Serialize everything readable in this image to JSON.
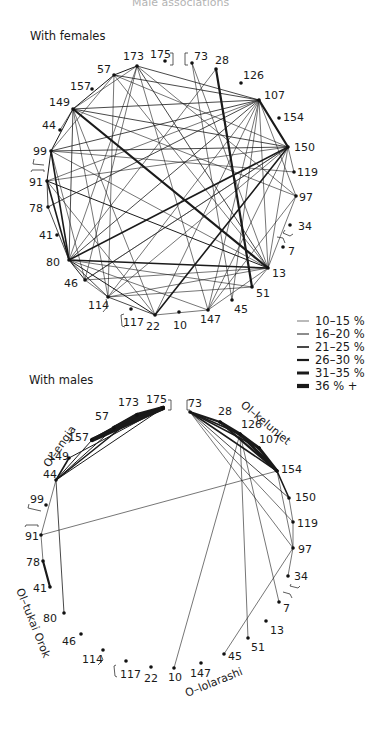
{
  "page_title": "Male associations",
  "legend": {
    "items": [
      {
        "label": "10–15 %",
        "width": 0.6
      },
      {
        "label": "16–20 %",
        "width": 1.0
      },
      {
        "label": "21–25 %",
        "width": 1.6
      },
      {
        "label": "26–30 %",
        "width": 2.2
      },
      {
        "label": "31–35 %",
        "width": 3.0
      },
      {
        "label": "36 % +",
        "width": 4.2
      }
    ]
  },
  "females_graph": {
    "title": "With females",
    "nodes": [
      {
        "id": "173",
        "x": 137,
        "y": 66,
        "lx": 123,
        "ly": 60
      },
      {
        "id": "175",
        "x": 165,
        "y": 61,
        "lx": 150,
        "ly": 58
      },
      {
        "id": "73",
        "x": 192,
        "y": 63,
        "lx": 194,
        "ly": 60
      },
      {
        "id": "28",
        "x": 216,
        "y": 69,
        "lx": 215,
        "ly": 64
      },
      {
        "id": "126",
        "x": 241,
        "y": 83,
        "lx": 243,
        "ly": 79
      },
      {
        "id": "107",
        "x": 259,
        "y": 100,
        "lx": 264,
        "ly": 99
      },
      {
        "id": "154",
        "x": 279,
        "y": 118,
        "lx": 283,
        "ly": 121
      },
      {
        "id": "150",
        "x": 288,
        "y": 147,
        "lx": 294,
        "ly": 151
      },
      {
        "id": "119",
        "x": 294,
        "y": 172,
        "lx": 297,
        "ly": 176
      },
      {
        "id": "97",
        "x": 296,
        "y": 196,
        "lx": 299,
        "ly": 201
      },
      {
        "id": "34",
        "x": 290,
        "y": 225,
        "lx": 298,
        "ly": 230
      },
      {
        "id": "7",
        "x": 283,
        "y": 247,
        "lx": 288,
        "ly": 255
      },
      {
        "id": "13",
        "x": 268,
        "y": 268,
        "lx": 272,
        "ly": 277
      },
      {
        "id": "51",
        "x": 252,
        "y": 287,
        "lx": 256,
        "ly": 297
      },
      {
        "id": "45",
        "x": 232,
        "y": 300,
        "lx": 234,
        "ly": 313
      },
      {
        "id": "147",
        "x": 208,
        "y": 310,
        "lx": 200,
        "ly": 323
      },
      {
        "id": "10",
        "x": 179,
        "y": 312,
        "lx": 173,
        "ly": 329
      },
      {
        "id": "22",
        "x": 155,
        "y": 315,
        "lx": 146,
        "ly": 330
      },
      {
        "id": "117",
        "x": 131,
        "y": 309,
        "lx": 123,
        "ly": 326
      },
      {
        "id": "114",
        "x": 108,
        "y": 297,
        "lx": 88,
        "ly": 309
      },
      {
        "id": "46",
        "x": 85,
        "y": 280,
        "lx": 64,
        "ly": 287
      },
      {
        "id": "80",
        "x": 69,
        "y": 260,
        "lx": 46,
        "ly": 266
      },
      {
        "id": "41",
        "x": 57,
        "y": 235,
        "lx": 39,
        "ly": 239
      },
      {
        "id": "78",
        "x": 48,
        "y": 207,
        "lx": 29,
        "ly": 212
      },
      {
        "id": "91",
        "x": 47,
        "y": 181,
        "lx": 29,
        "ly": 186
      },
      {
        "id": "99",
        "x": 51,
        "y": 151,
        "lx": 33,
        "ly": 155
      },
      {
        "id": "44",
        "x": 60,
        "y": 130,
        "lx": 42,
        "ly": 129
      },
      {
        "id": "149",
        "x": 73,
        "y": 109,
        "lx": 49,
        "ly": 106
      },
      {
        "id": "157",
        "x": 92,
        "y": 89,
        "lx": 70,
        "ly": 90
      },
      {
        "id": "57",
        "x": 114,
        "y": 75,
        "lx": 97,
        "ly": 73
      }
    ],
    "edges": [
      [
        "173",
        "57",
        1.0
      ],
      [
        "173",
        "107",
        0.8
      ],
      [
        "173",
        "149",
        0.6
      ],
      [
        "173",
        "80",
        0.6
      ],
      [
        "173",
        "46",
        0.6
      ],
      [
        "173",
        "13",
        0.8
      ],
      [
        "173",
        "147",
        0.6
      ],
      [
        "173",
        "97",
        0.6
      ],
      [
        "57",
        "149",
        1.0
      ],
      [
        "57",
        "107",
        0.8
      ],
      [
        "57",
        "99",
        0.6
      ],
      [
        "57",
        "13",
        0.6
      ],
      [
        "57",
        "114",
        0.6
      ],
      [
        "57",
        "150",
        0.6
      ],
      [
        "73",
        "13",
        0.6
      ],
      [
        "73",
        "45",
        0.6
      ],
      [
        "28",
        "51",
        2.2
      ],
      [
        "28",
        "80",
        0.6
      ],
      [
        "107",
        "150",
        2.2
      ],
      [
        "107",
        "149",
        0.8
      ],
      [
        "107",
        "99",
        0.8
      ],
      [
        "107",
        "91",
        0.6
      ],
      [
        "107",
        "80",
        0.8
      ],
      [
        "107",
        "114",
        0.6
      ],
      [
        "107",
        "22",
        0.6
      ],
      [
        "107",
        "147",
        0.6
      ],
      [
        "107",
        "13",
        0.6
      ],
      [
        "107",
        "45",
        0.6
      ],
      [
        "107",
        "97",
        0.6
      ],
      [
        "150",
        "149",
        0.8
      ],
      [
        "150",
        "99",
        0.8
      ],
      [
        "150",
        "80",
        1.6
      ],
      [
        "150",
        "91",
        0.6
      ],
      [
        "150",
        "46",
        0.6
      ],
      [
        "150",
        "114",
        0.6
      ],
      [
        "150",
        "22",
        1.6
      ],
      [
        "150",
        "13",
        0.6
      ],
      [
        "150",
        "119",
        0.6
      ],
      [
        "150",
        "147",
        0.6
      ],
      [
        "149",
        "13",
        2.2
      ],
      [
        "149",
        "99",
        1.0
      ],
      [
        "149",
        "80",
        0.8
      ],
      [
        "149",
        "114",
        0.6
      ],
      [
        "149",
        "22",
        0.6
      ],
      [
        "149",
        "97",
        0.6
      ],
      [
        "149",
        "44",
        0.6
      ],
      [
        "99",
        "91",
        1.0
      ],
      [
        "99",
        "80",
        1.6
      ],
      [
        "99",
        "13",
        0.6
      ],
      [
        "99",
        "119",
        0.6
      ],
      [
        "99",
        "46",
        0.6
      ],
      [
        "91",
        "80",
        1.6
      ],
      [
        "91",
        "78",
        0.8
      ],
      [
        "91",
        "13",
        1.0
      ],
      [
        "91",
        "22",
        0.6
      ],
      [
        "78",
        "107",
        0.8
      ],
      [
        "78",
        "80",
        0.8
      ],
      [
        "80",
        "13",
        1.6
      ],
      [
        "80",
        "46",
        1.0
      ],
      [
        "80",
        "114",
        0.8
      ],
      [
        "80",
        "22",
        1.0
      ],
      [
        "80",
        "51",
        0.6
      ],
      [
        "80",
        "147",
        0.6
      ],
      [
        "46",
        "114",
        0.6
      ],
      [
        "46",
        "13",
        0.6
      ],
      [
        "46",
        "150",
        0.6
      ],
      [
        "114",
        "22",
        0.8
      ],
      [
        "114",
        "13",
        0.6
      ],
      [
        "114",
        "51",
        0.6
      ],
      [
        "22",
        "147",
        0.6
      ],
      [
        "147",
        "13",
        0.6
      ],
      [
        "147",
        "97",
        0.6
      ],
      [
        "13",
        "51",
        0.6
      ],
      [
        "13",
        "97",
        0.6
      ]
    ],
    "brackets": [
      {
        "label": "175]",
        "x": 173,
        "y": 62
      },
      {
        "label": "[73",
        "x": 185,
        "y": 62
      }
    ]
  },
  "males_graph": {
    "title": "With males",
    "nodes": [
      {
        "id": "173",
        "x": 137,
        "y": 415,
        "lx": 118,
        "ly": 406
      },
      {
        "id": "175",
        "x": 163,
        "y": 408,
        "lx": 146,
        "ly": 403
      },
      {
        "id": "73",
        "x": 190,
        "y": 412,
        "lx": 188,
        "ly": 407
      },
      {
        "id": "28",
        "x": 220,
        "y": 422,
        "lx": 218,
        "ly": 415
      },
      {
        "id": "126",
        "x": 240,
        "y": 434,
        "lx": 241,
        "ly": 428
      },
      {
        "id": "107",
        "x": 259,
        "y": 448,
        "lx": 259,
        "ly": 443
      },
      {
        "id": "154",
        "x": 277,
        "y": 471,
        "lx": 281,
        "ly": 473
      },
      {
        "id": "150",
        "x": 289,
        "y": 498,
        "lx": 295,
        "ly": 501
      },
      {
        "id": "119",
        "x": 293,
        "y": 522,
        "lx": 297,
        "ly": 527
      },
      {
        "id": "97",
        "x": 293,
        "y": 548,
        "lx": 298,
        "ly": 553
      },
      {
        "id": "34",
        "x": 288,
        "y": 576,
        "lx": 294,
        "ly": 580
      },
      {
        "id": "7",
        "x": 279,
        "y": 602,
        "lx": 283,
        "ly": 612
      },
      {
        "id": "13",
        "x": 266,
        "y": 621,
        "lx": 270,
        "ly": 634
      },
      {
        "id": "51",
        "x": 248,
        "y": 638,
        "lx": 251,
        "ly": 651
      },
      {
        "id": "45",
        "x": 224,
        "y": 654,
        "lx": 228,
        "ly": 660
      },
      {
        "id": "147",
        "x": 201,
        "y": 663,
        "lx": 190,
        "ly": 677
      },
      {
        "id": "10",
        "x": 174,
        "y": 668,
        "lx": 168,
        "ly": 681
      },
      {
        "id": "22",
        "x": 151,
        "y": 667,
        "lx": 144,
        "ly": 682
      },
      {
        "id": "117",
        "x": 126,
        "y": 661,
        "lx": 120,
        "ly": 678
      },
      {
        "id": "114",
        "x": 103,
        "y": 650,
        "lx": 82,
        "ly": 663
      },
      {
        "id": "46",
        "x": 81,
        "y": 634,
        "lx": 62,
        "ly": 645
      },
      {
        "id": "80",
        "x": 64,
        "y": 613,
        "lx": 43,
        "ly": 622
      },
      {
        "id": "41",
        "x": 50,
        "y": 587,
        "lx": 33,
        "ly": 592
      },
      {
        "id": "78",
        "x": 43,
        "y": 561,
        "lx": 26,
        "ly": 566
      },
      {
        "id": "91",
        "x": 41,
        "y": 535,
        "lx": 25,
        "ly": 540
      },
      {
        "id": "99",
        "x": 46,
        "y": 505,
        "lx": 30,
        "ly": 503
      },
      {
        "id": "44",
        "x": 56,
        "y": 480,
        "lx": 43,
        "ly": 478
      },
      {
        "id": "149",
        "x": 69,
        "y": 458,
        "lx": 48,
        "ly": 460
      },
      {
        "id": "157",
        "x": 92,
        "y": 440,
        "lx": 68,
        "ly": 441
      },
      {
        "id": "57",
        "x": 114,
        "y": 428,
        "lx": 95,
        "ly": 420
      }
    ],
    "edges": [
      [
        "173",
        "175",
        4.2
      ],
      [
        "173",
        "57",
        4.2
      ],
      [
        "175",
        "57",
        4.2
      ],
      [
        "175",
        "157",
        4.2
      ],
      [
        "173",
        "157",
        3.0
      ],
      [
        "57",
        "157",
        3.0
      ],
      [
        "175",
        "149",
        1.0
      ],
      [
        "173",
        "44",
        1.6
      ],
      [
        "175",
        "44",
        1.0
      ],
      [
        "57",
        "44",
        1.0
      ],
      [
        "157",
        "44",
        1.0
      ],
      [
        "149",
        "44",
        1.6
      ],
      [
        "44",
        "91",
        0.6
      ],
      [
        "44",
        "80",
        0.8
      ],
      [
        "91",
        "154",
        0.6
      ],
      [
        "91",
        "78",
        0.6
      ],
      [
        "78",
        "41",
        2.2
      ],
      [
        "73",
        "28",
        2.2
      ],
      [
        "73",
        "126",
        1.6
      ],
      [
        "73",
        "107",
        1.6
      ],
      [
        "73",
        "154",
        1.6
      ],
      [
        "73",
        "150",
        0.8
      ],
      [
        "73",
        "97",
        0.6
      ],
      [
        "73",
        "119",
        0.6
      ],
      [
        "28",
        "126",
        3.0
      ],
      [
        "28",
        "107",
        2.2
      ],
      [
        "28",
        "154",
        2.2
      ],
      [
        "126",
        "107",
        3.0
      ],
      [
        "126",
        "154",
        3.0
      ],
      [
        "107",
        "154",
        3.0
      ],
      [
        "126",
        "10",
        0.6
      ],
      [
        "126",
        "51",
        0.6
      ],
      [
        "126",
        "7",
        0.6
      ],
      [
        "154",
        "150",
        1.6
      ],
      [
        "154",
        "97",
        0.6
      ],
      [
        "150",
        "119",
        0.6
      ],
      [
        "119",
        "97",
        0.6
      ],
      [
        "97",
        "34",
        0.6
      ],
      [
        "97",
        "45",
        0.6
      ]
    ],
    "group_labels": [
      {
        "text": "Ol–engia",
        "x": 49,
        "y": 468,
        "rotate": -55
      },
      {
        "text": "Ol–keluniet",
        "x": 240,
        "y": 406,
        "rotate": 40
      },
      {
        "text": "Ol–tukai Orok",
        "x": 16,
        "y": 590,
        "rotate": 68
      },
      {
        "text": "O–lolarashi",
        "x": 187,
        "y": 697,
        "rotate": -22
      }
    ]
  }
}
